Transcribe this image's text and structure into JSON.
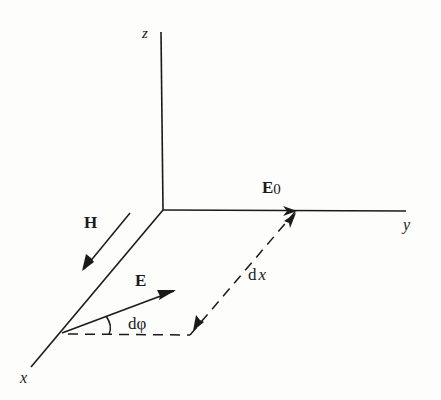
{
  "diagram": {
    "type": "3d-coordinate-vector-diagram",
    "axes": {
      "x": {
        "label": "x"
      },
      "y": {
        "label": "y"
      },
      "z": {
        "label": "z"
      }
    },
    "vectors": [
      {
        "id": "E0",
        "label": "E",
        "subscript": "0",
        "direction": "+y along y-axis"
      },
      {
        "id": "H",
        "label": "H",
        "direction": "+x parallel to x-axis"
      },
      {
        "id": "E",
        "label": "E",
        "direction": "rotated by dφ from x-direction toward y"
      }
    ],
    "annotations": {
      "angle": "dφ",
      "displacement_prefix": "d",
      "displacement_var": "x"
    },
    "colors": {
      "ink": "#1a1a1a",
      "background": "#fdfdfc"
    }
  }
}
